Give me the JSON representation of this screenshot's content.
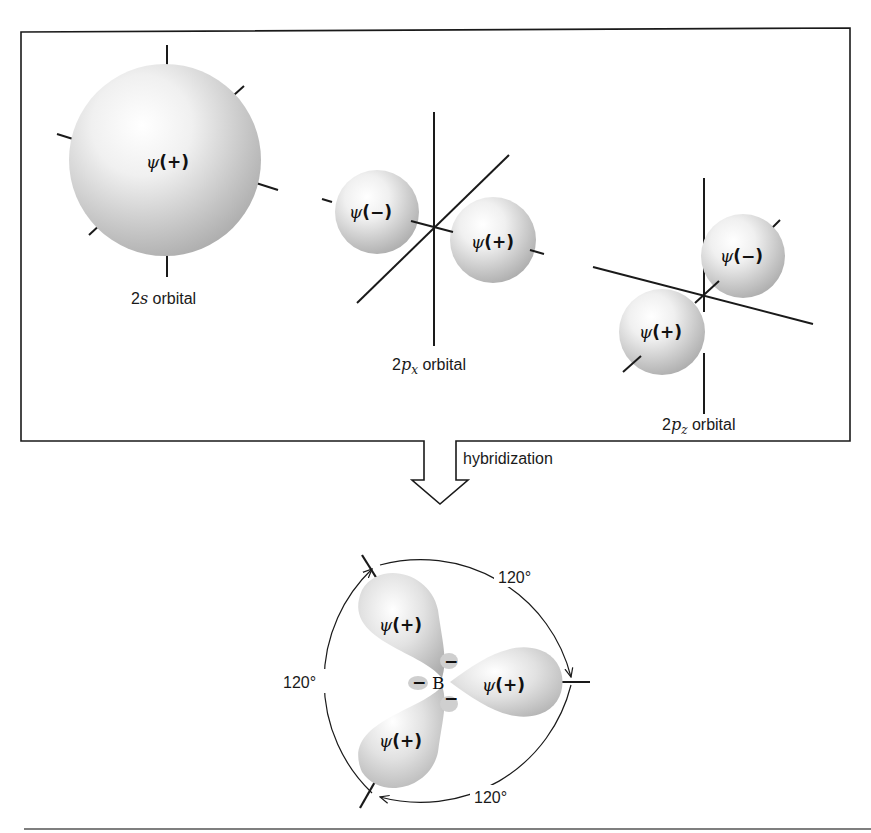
{
  "figure": {
    "top_panel": {
      "orbitals": [
        {
          "id": "2s",
          "label_prefix": "2",
          "label_italic": "s",
          "label_subscript": "",
          "label_suffix": " orbital",
          "lobes": [
            {
              "psi": "ψ",
              "sign": "(+)"
            }
          ]
        },
        {
          "id": "2px",
          "label_prefix": "2",
          "label_italic": "p",
          "label_subscript": "x",
          "label_suffix": " orbital",
          "lobes": [
            {
              "psi": "ψ",
              "sign": "(−)"
            },
            {
              "psi": "ψ",
              "sign": "(+)"
            }
          ]
        },
        {
          "id": "2pz",
          "label_prefix": "2",
          "label_italic": "p",
          "label_subscript": "z",
          "label_suffix": " orbital",
          "lobes": [
            {
              "psi": "ψ",
              "sign": "(−)"
            },
            {
              "psi": "ψ",
              "sign": "(+)"
            }
          ]
        }
      ]
    },
    "arrow": {
      "label": "hybridization"
    },
    "bottom_panel": {
      "center_atom": "B",
      "small_lobe_sign": "−",
      "lobes": [
        {
          "psi": "ψ",
          "sign": "(+)"
        },
        {
          "psi": "ψ",
          "sign": "(+)"
        },
        {
          "psi": "ψ",
          "sign": "(+)"
        }
      ],
      "angles": [
        "120°",
        "120°",
        "120°"
      ]
    },
    "colors": {
      "line": "#1a1a1a",
      "orbital_light": "#ffffff",
      "orbital_dark": "#a9a9a9",
      "background": "#ffffff"
    }
  }
}
